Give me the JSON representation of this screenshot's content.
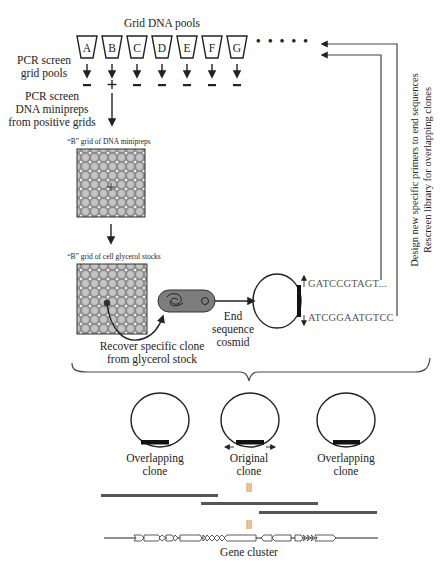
{
  "title": "Grid DNA pools",
  "pools": [
    {
      "label": "A",
      "result": "-"
    },
    {
      "label": "B",
      "result": "+"
    },
    {
      "label": "C",
      "result": "-"
    },
    {
      "label": "D",
      "result": "-"
    },
    {
      "label": "E",
      "result": "-"
    },
    {
      "label": "F",
      "result": "-"
    },
    {
      "label": "G",
      "result": "-"
    }
  ],
  "ellipsis": "• • • • •",
  "steps": {
    "pcr_grid_line1": "PCR screen",
    "pcr_grid_line2": "grid pools",
    "pcr_mini_line1": "PCR screen",
    "pcr_mini_line2": "DNA minipreps",
    "pcr_mini_line3": "from positive grids",
    "grid_minipreps": "“B” grid of DNA minipreps",
    "grid_glycerol": "“B” grid of cell glycerol stocks",
    "recover_line1": "Recover specific clone",
    "recover_line2": "from glycerol stock",
    "end_seq_line1": "End",
    "end_seq_line2": "sequence",
    "end_seq_line3": "cosmid"
  },
  "sequences": {
    "top": "GATCCGTAGT...",
    "bottom": "ATCGGAATGTCC"
  },
  "feedback": {
    "line1": "Design new specific primers to end sequences",
    "line2": "Rescreen library for overlapping clones"
  },
  "clones": [
    {
      "line1": "Overlapping",
      "line2": "clone"
    },
    {
      "line1": "Original",
      "line2": "clone"
    },
    {
      "line1": "Overlapping",
      "line2": "clone"
    }
  ],
  "equiv_symbol": "|||",
  "gene_cluster_label": "Gene cluster",
  "colors": {
    "ink": "#222222",
    "grid_fill": "#9a9a9a",
    "contig_bar": "#555555",
    "sequence_text": "#555555"
  }
}
